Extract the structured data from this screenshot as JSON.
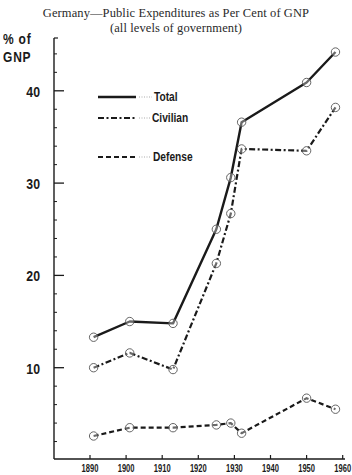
{
  "chart_data": {
    "type": "line",
    "title": "Germany—Public Expenditures as Per Cent of GNP",
    "subtitle": "(all levels of government)",
    "xlabel": "",
    "ylabel": "% of GNP",
    "ylabel_lines": [
      "% of",
      "GNP"
    ],
    "xlim": [
      1890,
      1960
    ],
    "ylim": [
      0,
      45
    ],
    "x_ticks": [
      "1890",
      "1900",
      "1910",
      "1920",
      "1930",
      "1940",
      "1950",
      "1960"
    ],
    "y_ticks": [
      "10",
      "20",
      "30",
      "40"
    ],
    "grid": false,
    "legend_position": "upper-left inside",
    "markers": "open circles",
    "x": [
      1891,
      1901,
      1913,
      1925,
      1929,
      1932,
      1950,
      1958
    ],
    "series": [
      {
        "name": "Total",
        "style": "solid",
        "values": [
          13.3,
          15.0,
          14.8,
          25.0,
          30.6,
          36.6,
          40.9,
          44.2
        ]
      },
      {
        "name": "Civilian",
        "style": "dash-dot",
        "values": [
          10.0,
          11.6,
          9.8,
          21.3,
          26.7,
          33.7,
          33.5,
          38.2
        ]
      },
      {
        "name": "Defense",
        "style": "dashed",
        "values": [
          2.6,
          3.5,
          3.5,
          3.8,
          4.0,
          2.9,
          6.7,
          5.5
        ]
      }
    ]
  },
  "title": {
    "line1": "Germany—Public Expenditures as Per Cent of GNP",
    "line2": "(all levels of government)"
  },
  "y_axis": {
    "label_line1": "% of",
    "label_line2": "GNP"
  },
  "legend": {
    "items": [
      {
        "label": "Total"
      },
      {
        "label": "Civilian"
      },
      {
        "label": "Defense"
      }
    ]
  },
  "colors": {
    "ink": "#1a1a1a",
    "marker": "#555555",
    "background": "#ffffff"
  }
}
